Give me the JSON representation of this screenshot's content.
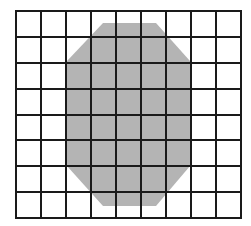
{
  "diagram": {
    "type": "grid-with-shape",
    "grid": {
      "columns": 9,
      "rows": 8,
      "x_lines": [
        16,
        41,
        66,
        91,
        116,
        141,
        166,
        191,
        216,
        241
      ],
      "y_lines": [
        11,
        37,
        63,
        89,
        115,
        140,
        166,
        192,
        218
      ],
      "line_color": "#1a1a1a",
      "line_width": 2
    },
    "shape": {
      "kind": "octagon",
      "fill": "#b4b4b4",
      "points": [
        [
          103,
          23
        ],
        [
          156,
          23
        ],
        [
          190,
          61
        ],
        [
          190,
          166
        ],
        [
          156,
          206
        ],
        [
          103,
          206
        ],
        [
          67,
          166
        ],
        [
          67,
          61
        ]
      ]
    },
    "background": "#ffffff"
  }
}
